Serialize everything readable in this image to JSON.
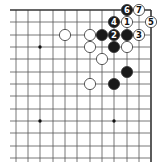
{
  "diagram": {
    "type": "go-board-corner",
    "corner": "top-right",
    "columns_x": [
      16,
      28,
      40,
      53,
      65,
      77,
      90,
      102,
      114,
      127,
      139,
      151
    ],
    "rows_y": [
      10,
      22,
      35,
      47,
      59,
      72,
      84,
      96,
      109,
      121,
      133,
      146,
      158
    ],
    "grid_extent": {
      "left": 10,
      "right": 151,
      "top": 10,
      "bottom": 162
    },
    "edges": {
      "top": true,
      "right": true
    },
    "star_points": [
      [
        40,
        47
      ],
      [
        40,
        121
      ],
      [
        114,
        121
      ]
    ],
    "stones": [
      {
        "color": "black",
        "x": 127,
        "y": 10,
        "label": "6"
      },
      {
        "color": "white",
        "x": 139,
        "y": 10,
        "label": "7"
      },
      {
        "color": "black",
        "x": 114,
        "y": 22,
        "label": "4"
      },
      {
        "color": "white",
        "x": 127,
        "y": 22,
        "label": "1"
      },
      {
        "color": "white",
        "x": 151,
        "y": 22,
        "label": "5"
      },
      {
        "color": "white",
        "x": 65,
        "y": 35,
        "label": ""
      },
      {
        "color": "white",
        "x": 90,
        "y": 35,
        "label": ""
      },
      {
        "color": "black",
        "x": 102,
        "y": 35,
        "label": ""
      },
      {
        "color": "black",
        "x": 114,
        "y": 35,
        "label": "2"
      },
      {
        "color": "black",
        "x": 127,
        "y": 35,
        "label": ""
      },
      {
        "color": "white",
        "x": 139,
        "y": 35,
        "label": "3"
      },
      {
        "color": "white",
        "x": 90,
        "y": 47,
        "label": ""
      },
      {
        "color": "black",
        "x": 114,
        "y": 47,
        "label": ""
      },
      {
        "color": "white",
        "x": 127,
        "y": 47,
        "label": ""
      },
      {
        "color": "white",
        "x": 102,
        "y": 59,
        "label": ""
      },
      {
        "color": "black",
        "x": 127,
        "y": 72,
        "label": ""
      },
      {
        "color": "white",
        "x": 90,
        "y": 84,
        "label": ""
      },
      {
        "color": "black",
        "x": 114,
        "y": 84,
        "label": ""
      }
    ],
    "colors": {
      "line": "#555555",
      "edge": "#333333",
      "black_stone": "#1a1a1a",
      "white_stone": "#ffffff",
      "stone_outline": "#333333"
    }
  }
}
